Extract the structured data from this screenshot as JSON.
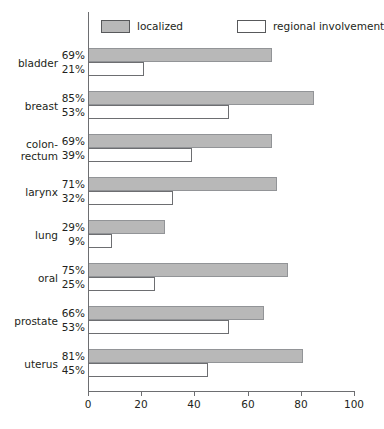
{
  "chart_data": {
    "type": "bar",
    "orientation": "horizontal",
    "title": "",
    "xlabel": "",
    "ylabel": "",
    "xlim": [
      0,
      100
    ],
    "xticks": [
      0,
      20,
      40,
      60,
      80,
      100
    ],
    "grid": false,
    "legend_position": "top",
    "categories": [
      "bladder",
      "breast",
      "colon-\nrectum",
      "larynx",
      "lung",
      "oral",
      "prostate",
      "uterus"
    ],
    "series": [
      {
        "name": "localized",
        "color": "#b8b8b8",
        "values": [
          69,
          85,
          69,
          71,
          29,
          75,
          66,
          81
        ],
        "value_labels": [
          "69%",
          "85%",
          "69%",
          "71%",
          "29%",
          "75%",
          "66%",
          "81%"
        ]
      },
      {
        "name": "regional involvement",
        "color": "#ffffff",
        "values": [
          21,
          53,
          39,
          32,
          9,
          25,
          53,
          45
        ],
        "value_labels": [
          "21%",
          "53%",
          "39%",
          "32%",
          "9%",
          "25%",
          "53%",
          "45%"
        ]
      }
    ]
  },
  "legend": {
    "entries": [
      {
        "label": "localized",
        "swatch": "gray-filled-swatch"
      },
      {
        "label": "regional involvement",
        "swatch": "white-outlined-swatch"
      }
    ]
  },
  "axis": {
    "tick_labels": [
      "0",
      "20",
      "40",
      "60",
      "80",
      "100"
    ]
  },
  "categories": [
    {
      "label_line1": "bladder",
      "label_line2": ""
    },
    {
      "label_line1": "breast",
      "label_line2": ""
    },
    {
      "label_line1": "colon-",
      "label_line2": "rectum"
    },
    {
      "label_line1": "larynx",
      "label_line2": ""
    },
    {
      "label_line1": "lung",
      "label_line2": ""
    },
    {
      "label_line1": "oral",
      "label_line2": ""
    },
    {
      "label_line1": "prostate",
      "label_line2": ""
    },
    {
      "label_line1": "uterus",
      "label_line2": ""
    }
  ],
  "colors": {
    "localized_fill": "#b8b8b8",
    "regional_fill": "#ffffff",
    "bar_stroke": "#6d6e71",
    "axis": "#6d6e71",
    "text": "#231f20",
    "background": "#ffffff"
  }
}
